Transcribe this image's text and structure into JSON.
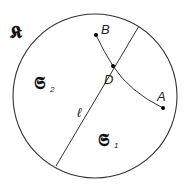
{
  "diagram": {
    "set_label": "𝕶",
    "region_left": {
      "symbol": "𝕾",
      "subscript": "2"
    },
    "region_right": {
      "symbol": "𝕾",
      "subscript": "1"
    },
    "line_label": "ℓ",
    "points": {
      "A": "A",
      "B": "B",
      "D": "D"
    },
    "colors": {
      "stroke": "#333333",
      "point": "#000000",
      "background": "#ffffff"
    }
  }
}
